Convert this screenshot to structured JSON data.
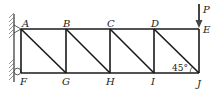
{
  "diagram": {
    "type": "truss",
    "nodes": {
      "top": [
        "A",
        "B",
        "C",
        "D",
        "E"
      ],
      "bottom": [
        "F",
        "G",
        "H",
        "I",
        "J"
      ]
    },
    "labels": {
      "A": "A",
      "B": "B",
      "C": "C",
      "D": "D",
      "E": "E",
      "F": "F",
      "G": "G",
      "H": "H",
      "I": "I",
      "J": "J",
      "P": "P"
    },
    "angle_label": "45°",
    "load": "P",
    "colors": {
      "line": "#1a1a1a",
      "hatch": "#555555"
    }
  }
}
